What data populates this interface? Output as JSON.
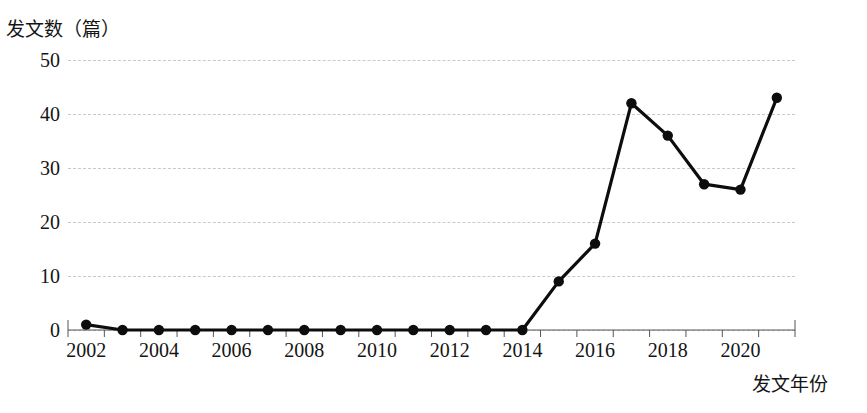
{
  "chart_data": {
    "type": "line",
    "title": "",
    "xlabel": "发文年份",
    "ylabel": "发文数（篇）",
    "x": [
      2002,
      2003,
      2004,
      2005,
      2006,
      2007,
      2008,
      2009,
      2010,
      2011,
      2012,
      2013,
      2014,
      2015,
      2016,
      2017,
      2018,
      2019,
      2020,
      2021
    ],
    "values": [
      1,
      0,
      0,
      0,
      0,
      0,
      0,
      0,
      0,
      0,
      0,
      0,
      0,
      9,
      16,
      42,
      36,
      27,
      26,
      43
    ],
    "series": [
      {
        "name": "发文数",
        "values": [
          1,
          0,
          0,
          0,
          0,
          0,
          0,
          0,
          0,
          0,
          0,
          0,
          0,
          9,
          16,
          42,
          36,
          27,
          26,
          43
        ]
      }
    ],
    "xlim": [
      2001.5,
      2021.5
    ],
    "ylim": [
      0,
      50
    ],
    "yticks": [
      0,
      10,
      20,
      30,
      40,
      50
    ],
    "ytick_labels": [
      "0",
      "10",
      "20",
      "30",
      "40",
      "50"
    ],
    "xticks": [
      2002,
      2004,
      2006,
      2008,
      2010,
      2012,
      2014,
      2016,
      2018,
      2020
    ],
    "xtick_labels": [
      "2002",
      "2004",
      "2006",
      "2008",
      "2010",
      "2012",
      "2014",
      "2016",
      "2018",
      "2020"
    ],
    "grid": "horizontal-dashed",
    "legend": "none",
    "line_color": "#0d0d0d",
    "marker": "circle",
    "marker_color": "#0d0d0d",
    "grid_color": "#c9c9c9",
    "background_color": "#ffffff"
  }
}
